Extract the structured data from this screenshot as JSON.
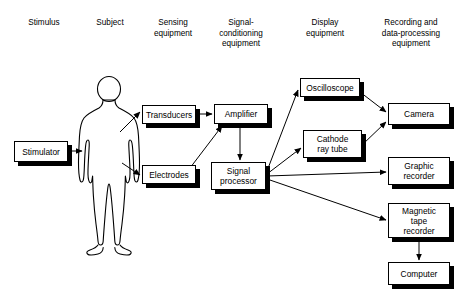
{
  "diagram": {
    "background_color": "#ffffff",
    "line_color": "#000000",
    "box_fill_color": "#ffffff",
    "shadow_color": "#000000"
  },
  "column_headers": [
    {
      "label": "Stimulus",
      "x": 14,
      "y": 18,
      "w": 60
    },
    {
      "label": "Subject",
      "x": 80,
      "y": 18,
      "w": 60
    },
    {
      "label": "Sensing\nequipment",
      "x": 140,
      "y": 18,
      "w": 66
    },
    {
      "label": "Signal-\nconditioning\nequipment",
      "x": 206,
      "y": 18,
      "w": 70
    },
    {
      "label": "Display\nequipment",
      "x": 292,
      "y": 18,
      "w": 66
    },
    {
      "label": "Recording and\ndata-processing\nequipment",
      "x": 368,
      "y": 18,
      "w": 86
    }
  ],
  "nodes": [
    {
      "id": "stimulator",
      "label": "Stimulator",
      "x": 14,
      "y": 141,
      "w": 54,
      "h": 21
    },
    {
      "id": "transducers",
      "label": "Transducers",
      "x": 142,
      "y": 105,
      "w": 54,
      "h": 19
    },
    {
      "id": "electrodes",
      "label": "Electrodes",
      "x": 142,
      "y": 165,
      "w": 54,
      "h": 19
    },
    {
      "id": "amplifier",
      "label": "Amplifier",
      "x": 214,
      "y": 104,
      "w": 54,
      "h": 20
    },
    {
      "id": "signal-processor",
      "label": "Signal\nprocessor",
      "x": 211,
      "y": 162,
      "w": 55,
      "h": 28
    },
    {
      "id": "oscilloscope",
      "label": "Oscilloscope",
      "x": 300,
      "y": 78,
      "w": 60,
      "h": 19
    },
    {
      "id": "cathode-ray-tube",
      "label": "Cathode\nray tube",
      "x": 303,
      "y": 130,
      "w": 59,
      "h": 28
    },
    {
      "id": "camera",
      "label": "Camera",
      "x": 388,
      "y": 103,
      "w": 62,
      "h": 22
    },
    {
      "id": "graphic-recorder",
      "label": "Graphic\nrecorder",
      "x": 388,
      "y": 157,
      "w": 62,
      "h": 28
    },
    {
      "id": "magnetic-tape-recorder",
      "label": "Magnetic\ntape\nrecorder",
      "x": 388,
      "y": 203,
      "w": 62,
      "h": 35
    },
    {
      "id": "computer",
      "label": "Computer",
      "x": 388,
      "y": 262,
      "w": 62,
      "h": 23
    }
  ],
  "subject_figure": {
    "name": "human-body-outline",
    "x": 78,
    "y": 78,
    "w": 62,
    "h": 168
  },
  "edges": [
    {
      "from": "stimulator",
      "to": "subject-figure",
      "path": "M 68,151 L 82,151"
    },
    {
      "from": "subject-figure",
      "to": "transducers",
      "path": "M 120,132 L 140,112"
    },
    {
      "from": "subject-figure",
      "to": "electrodes",
      "path": "M 122,163 L 140,175"
    },
    {
      "from": "transducers",
      "to": "amplifier",
      "path": "M 196,114 L 212,114"
    },
    {
      "from": "electrodes",
      "to": "amplifier",
      "path": "M 190,168 L 222,126"
    },
    {
      "from": "amplifier",
      "to": "signal-processor",
      "path": "M 240,124 L 240,160"
    },
    {
      "from": "signal-processor",
      "to": "oscilloscope",
      "path": "M 267,171 L 298,90"
    },
    {
      "from": "signal-processor",
      "to": "cathode-ray-tube",
      "path": "M 267,174 L 301,148"
    },
    {
      "from": "signal-processor",
      "to": "graphic-recorder",
      "path": "M 267,176 L 386,172"
    },
    {
      "from": "signal-processor",
      "to": "magnetic-tape-recorder",
      "path": "M 267,179 L 386,220"
    },
    {
      "from": "oscilloscope",
      "to": "camera",
      "path": "M 360,92 L 386,112"
    },
    {
      "from": "cathode-ray-tube",
      "to": "camera",
      "path": "M 362,145 L 386,122"
    },
    {
      "from": "magnetic-tape-recorder",
      "to": "computer",
      "path": "M 419,238 L 419,260"
    }
  ]
}
